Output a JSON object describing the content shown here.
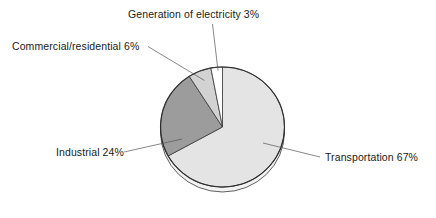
{
  "chart_data": {
    "type": "pie",
    "title": "",
    "subtitle": "",
    "xlabel": "",
    "ylabel": "",
    "legend_position": "none",
    "grid": false,
    "labels_placement": "outside-with-leader-lines",
    "style": "3d-pie",
    "categories": [
      "Transportation",
      "Industrial",
      "Commercial/residential",
      "Generation of electricity"
    ],
    "values": [
      67,
      24,
      6,
      3
    ],
    "unit": "%",
    "colors": [
      "#e4e4e4",
      "#9c9c9c",
      "#d2d2d2",
      "#ffffff"
    ],
    "slices": [
      {
        "name": "Transportation",
        "value": 67,
        "label": "Transportation 67%",
        "color": "#e4e4e4",
        "start_angle_deg": 0,
        "end_angle_deg": 241.2
      },
      {
        "name": "Industrial",
        "value": 24,
        "label": "Industrial 24%",
        "color": "#9c9c9c",
        "start_angle_deg": 241.2,
        "end_angle_deg": 327.6
      },
      {
        "name": "Commercial/residential",
        "value": 6,
        "label": "Commercial/residential 6%",
        "color": "#d2d2d2",
        "start_angle_deg": 327.6,
        "end_angle_deg": 349.2
      },
      {
        "name": "Generation of electricity",
        "value": 3,
        "label": "Generation of electricity 3%",
        "color": "#ffffff",
        "start_angle_deg": 349.2,
        "end_angle_deg": 360
      }
    ]
  },
  "labels": {
    "generation": "Generation of electricity 3%",
    "commercial": "Commercial/residential 6%",
    "industrial": "Industrial 24%",
    "transportation": "Transportation 67%"
  }
}
